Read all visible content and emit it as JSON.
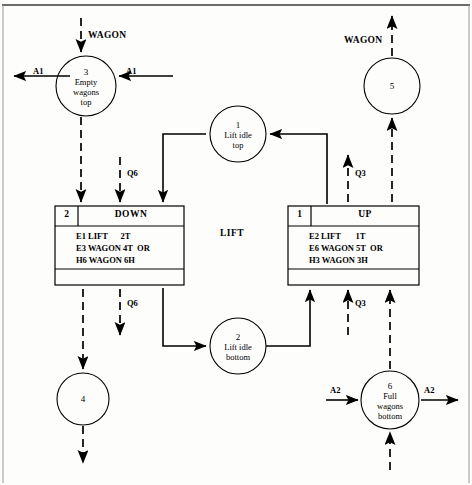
{
  "diagram": {
    "title": "LIFT",
    "center_label": "LIFT",
    "top_io_label_left": "WAGON",
    "top_io_label_right": "WAGON"
  },
  "places": [
    {
      "id": "3",
      "name_lines": [
        "Empty",
        "wagons",
        "top"
      ],
      "cx": 86,
      "cy": 86,
      "r": 30
    },
    {
      "id": "1",
      "name_lines": [
        "Lift idle",
        "top"
      ],
      "cx": 238,
      "cy": 134,
      "r": 28
    },
    {
      "id": "5",
      "name_lines": [],
      "cx": 392,
      "cy": 86,
      "r": 28
    },
    {
      "id": "2",
      "name_lines": [
        "Lift idle",
        "bottom"
      ],
      "cx": 238,
      "cy": 346,
      "r": 28
    },
    {
      "id": "4",
      "name_lines": [],
      "cx": 83,
      "cy": 399,
      "r": 26
    },
    {
      "id": "6",
      "name_lines": [
        "Full",
        "wagons",
        "bottom"
      ],
      "cx": 390,
      "cy": 400,
      "r": 29
    }
  ],
  "transitions": [
    {
      "key": "down",
      "id": "2",
      "name": "DOWN",
      "guard_lines": [
        "E1 LIFT      2T",
        "E3 WAGON 4T  OR",
        "H6 WAGON 6H"
      ],
      "x": 55,
      "y": 206,
      "w": 129,
      "h": 79
    },
    {
      "key": "up",
      "id": "1",
      "name": "UP",
      "guard_lines": [
        "E2 LIFT       1T",
        "E6 WAGON 5T  OR",
        "H3 WAGON 3H"
      ],
      "x": 288,
      "y": 206,
      "w": 131,
      "h": 79
    }
  ],
  "arc_labels": [
    {
      "text": "A1",
      "x": 33,
      "y": 69
    },
    {
      "text": "A1",
      "x": 126,
      "y": 69
    },
    {
      "text": "Q6",
      "x": 130,
      "y": 172
    },
    {
      "text": "Q6",
      "x": 130,
      "y": 306
    },
    {
      "text": "Q3",
      "x": 356,
      "y": 172
    },
    {
      "text": "Q3",
      "x": 356,
      "y": 306
    },
    {
      "text": "A2",
      "x": 336,
      "y": 389
    },
    {
      "text": "A2",
      "x": 428,
      "y": 389
    }
  ],
  "io_labels": [
    {
      "text": "WAGON",
      "x": 88,
      "y": 31
    },
    {
      "text": "WAGON",
      "x": 344,
      "y": 36
    }
  ],
  "colors": {
    "ink": "#000000",
    "paper": "#fdfdfc",
    "frame": "#333333"
  }
}
